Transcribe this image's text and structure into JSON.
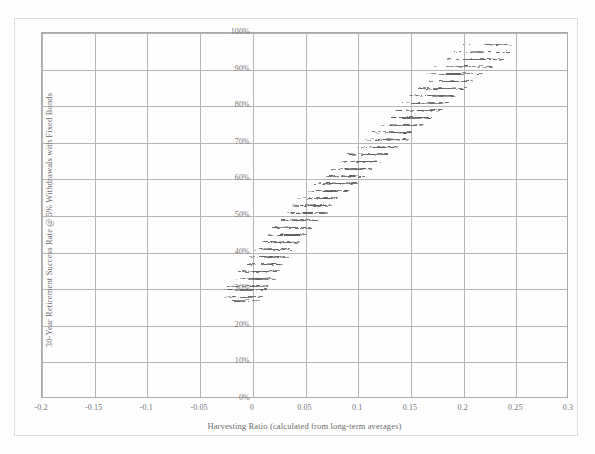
{
  "figure": {
    "xlabel": "Harvesting Ratio (calculated from long-term averages)",
    "ylabel": "30-Year Retirement Success Rate @ 5% Withdrawals with Fixed Bonds"
  },
  "chart_data": {
    "type": "scatter",
    "title": "",
    "xlabel": "Harvesting Ratio (calculated from long-term averages)",
    "ylabel": "30-Year Retirement Success Rate @ 5% Withdrawals with Fixed Bonds",
    "xlim": [
      -0.2,
      0.3
    ],
    "ylim": [
      0,
      100
    ],
    "xticks": [
      -0.2,
      -0.15,
      -0.1,
      -0.05,
      0,
      0.05,
      0.1,
      0.15,
      0.2,
      0.25,
      0.3
    ],
    "xtick_labels": [
      "-0.2",
      "-0.15",
      "-0.1",
      "-0.05",
      "0",
      "0.05",
      "0.1",
      "0.15",
      "0.2",
      "0.25",
      "0.3"
    ],
    "yticks": [
      0,
      10,
      20,
      30,
      40,
      50,
      60,
      70,
      80,
      90,
      100
    ],
    "ytick_labels": [
      "0%",
      "10%",
      "20%",
      "30%",
      "40%",
      "50%",
      "60%",
      "70%",
      "80%",
      "90%",
      "100%"
    ],
    "grid": true,
    "legend": null,
    "marker": "small-dash",
    "marker_color": "#3b3b3b",
    "bands": [
      {
        "y": 27,
        "x_min": -0.03,
        "x_max": 0.005,
        "n": 14
      },
      {
        "y": 28,
        "x_min": -0.032,
        "x_max": 0.008,
        "n": 18
      },
      {
        "y": 30,
        "x_min": -0.028,
        "x_max": 0.012,
        "n": 30
      },
      {
        "y": 31,
        "x_min": -0.024,
        "x_max": 0.014,
        "n": 26
      },
      {
        "y": 33,
        "x_min": -0.018,
        "x_max": 0.018,
        "n": 30
      },
      {
        "y": 35,
        "x_min": -0.014,
        "x_max": 0.022,
        "n": 32
      },
      {
        "y": 37,
        "x_min": -0.008,
        "x_max": 0.026,
        "n": 30
      },
      {
        "y": 39,
        "x_min": -0.004,
        "x_max": 0.03,
        "n": 32
      },
      {
        "y": 41,
        "x_min": 0.002,
        "x_max": 0.036,
        "n": 34
      },
      {
        "y": 43,
        "x_min": 0.006,
        "x_max": 0.042,
        "n": 34
      },
      {
        "y": 45,
        "x_min": 0.012,
        "x_max": 0.048,
        "n": 36
      },
      {
        "y": 47,
        "x_min": 0.018,
        "x_max": 0.054,
        "n": 36
      },
      {
        "y": 49,
        "x_min": 0.024,
        "x_max": 0.06,
        "n": 38
      },
      {
        "y": 51,
        "x_min": 0.03,
        "x_max": 0.068,
        "n": 38
      },
      {
        "y": 53,
        "x_min": 0.036,
        "x_max": 0.074,
        "n": 38
      },
      {
        "y": 55,
        "x_min": 0.042,
        "x_max": 0.08,
        "n": 36
      },
      {
        "y": 57,
        "x_min": 0.05,
        "x_max": 0.088,
        "n": 36
      },
      {
        "y": 59,
        "x_min": 0.058,
        "x_max": 0.096,
        "n": 36
      },
      {
        "y": 61,
        "x_min": 0.066,
        "x_max": 0.104,
        "n": 36
      },
      {
        "y": 63,
        "x_min": 0.074,
        "x_max": 0.112,
        "n": 34
      },
      {
        "y": 65,
        "x_min": 0.08,
        "x_max": 0.12,
        "n": 34
      },
      {
        "y": 67,
        "x_min": 0.088,
        "x_max": 0.128,
        "n": 34
      },
      {
        "y": 69,
        "x_min": 0.096,
        "x_max": 0.138,
        "n": 34
      },
      {
        "y": 71,
        "x_min": 0.104,
        "x_max": 0.146,
        "n": 32
      },
      {
        "y": 73,
        "x_min": 0.11,
        "x_max": 0.152,
        "n": 32
      },
      {
        "y": 75,
        "x_min": 0.118,
        "x_max": 0.16,
        "n": 32
      },
      {
        "y": 77,
        "x_min": 0.126,
        "x_max": 0.168,
        "n": 32
      },
      {
        "y": 79,
        "x_min": 0.132,
        "x_max": 0.176,
        "n": 30
      },
      {
        "y": 81,
        "x_min": 0.14,
        "x_max": 0.184,
        "n": 30
      },
      {
        "y": 83,
        "x_min": 0.146,
        "x_max": 0.192,
        "n": 30
      },
      {
        "y": 85,
        "x_min": 0.152,
        "x_max": 0.2,
        "n": 28
      },
      {
        "y": 87,
        "x_min": 0.158,
        "x_max": 0.208,
        "n": 28
      },
      {
        "y": 89,
        "x_min": 0.164,
        "x_max": 0.216,
        "n": 26
      },
      {
        "y": 91,
        "x_min": 0.17,
        "x_max": 0.226,
        "n": 24
      },
      {
        "y": 93,
        "x_min": 0.176,
        "x_max": 0.236,
        "n": 22
      },
      {
        "y": 95,
        "x_min": 0.184,
        "x_max": 0.244,
        "n": 16
      },
      {
        "y": 97,
        "x_min": 0.196,
        "x_max": 0.25,
        "n": 9
      }
    ]
  }
}
